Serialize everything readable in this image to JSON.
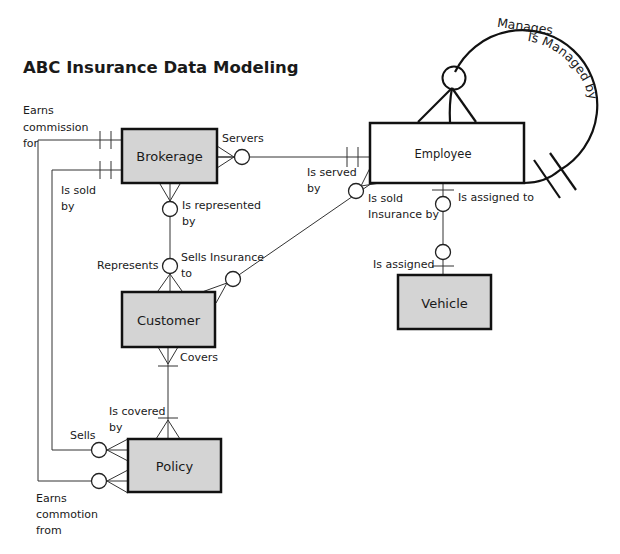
{
  "title": "ABC Insurance Data Modeling",
  "colors": {
    "entity_fill_shaded": "#d4d4d4",
    "entity_fill_plain": "#ffffff",
    "line": "#222222",
    "background": "#ffffff"
  },
  "entities": [
    {
      "id": "brokerage",
      "label": "Brokerage",
      "shaded": true
    },
    {
      "id": "employee",
      "label": "Employee",
      "shaded": false
    },
    {
      "id": "customer",
      "label": "Customer",
      "shaded": true
    },
    {
      "id": "vehicle",
      "label": "Vehicle",
      "shaded": true
    },
    {
      "id": "policy",
      "label": "Policy",
      "shaded": true
    }
  ],
  "relationships": [
    {
      "id": "earns-commission",
      "from": "Brokerage",
      "to": "Policy",
      "labels": [
        "Earns commission for",
        "Earns commotion from"
      ]
    },
    {
      "id": "sells",
      "from": "Brokerage",
      "to": "Policy",
      "labels": [
        "Is sold by",
        "Sells"
      ]
    },
    {
      "id": "serves",
      "from": "Brokerage",
      "to": "Employee",
      "labels": [
        "Servers",
        "Is served by"
      ]
    },
    {
      "id": "represents",
      "from": "Brokerage",
      "to": "Customer",
      "labels": [
        "Is represented by",
        "Represents"
      ]
    },
    {
      "id": "sells-insurance",
      "from": "Employee",
      "to": "Customer",
      "labels": [
        "Is sold Insurance by",
        "Sells Insurance to"
      ]
    },
    {
      "id": "assigned",
      "from": "Employee",
      "to": "Vehicle",
      "labels": [
        "Is assigned to",
        "Is assigned"
      ]
    },
    {
      "id": "covers",
      "from": "Customer",
      "to": "Policy",
      "labels": [
        "Covers",
        "Is covered by"
      ]
    },
    {
      "id": "manages",
      "from": "Employee",
      "to": "Employee",
      "labels": [
        "Manages",
        "Is Managed by"
      ]
    }
  ],
  "labels": {
    "earns_commission_1": "Earns",
    "earns_commission_2": "commission",
    "earns_commission_3": "for",
    "is_sold_1": "Is sold",
    "is_sold_2": "by",
    "servers": "Servers",
    "is_served_1": "Is served",
    "is_served_2": "by",
    "is_represented_1": "Is represented",
    "is_represented_2": "by",
    "represents": "Represents",
    "sells_insurance_1": "Sells Insurance",
    "sells_insurance_2": "to",
    "is_sold_insurance_1": "Is sold",
    "is_sold_insurance_2": "Insurance by",
    "is_assigned_to": "Is assigned to",
    "is_assigned": "Is assigned",
    "covers": "Covers",
    "is_covered_1": "Is covered",
    "is_covered_2": "by",
    "sells": "Sells",
    "earns_commotion_1": "Earns",
    "earns_commotion_2": "commotion",
    "earns_commotion_3": "from",
    "manages": "Manages",
    "is_managed_by": "Is Managed by"
  }
}
